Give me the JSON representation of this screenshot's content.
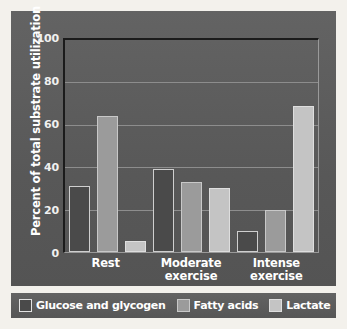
{
  "chart_data": {
    "type": "bar",
    "title": "",
    "xlabel": "",
    "ylabel": "Percent of total substrate utilization",
    "ylim": [
      0,
      100
    ],
    "yticks": [
      100,
      80,
      60,
      40,
      20,
      0
    ],
    "grid": true,
    "legend_position": "bottom",
    "categories": [
      "Rest",
      "Moderate exercise",
      "Intense exercise"
    ],
    "category_lines": [
      [
        "Rest"
      ],
      [
        "Moderate",
        "exercise"
      ],
      [
        "Intense",
        "exercise"
      ]
    ],
    "series": [
      {
        "name": "Glucose and glycogen",
        "color": "#4a4a4a",
        "border_color": "#cfcfcf",
        "values": [
          31,
          39,
          10
        ]
      },
      {
        "name": "Fatty acids",
        "color": "#9b9b9b",
        "border_color": "#c8c8c8",
        "values": [
          64,
          33,
          20
        ]
      },
      {
        "name": "Lactate",
        "color": "#c4c4c4",
        "border_color": "#dedede",
        "values": [
          5,
          30,
          69
        ]
      }
    ]
  },
  "colors": {
    "panel_background": "#5c5c5c",
    "page_background": "#f3f1ec",
    "axis": "#1b1b1b",
    "gridline": "#8d8d8d",
    "text": "#ffffff"
  }
}
